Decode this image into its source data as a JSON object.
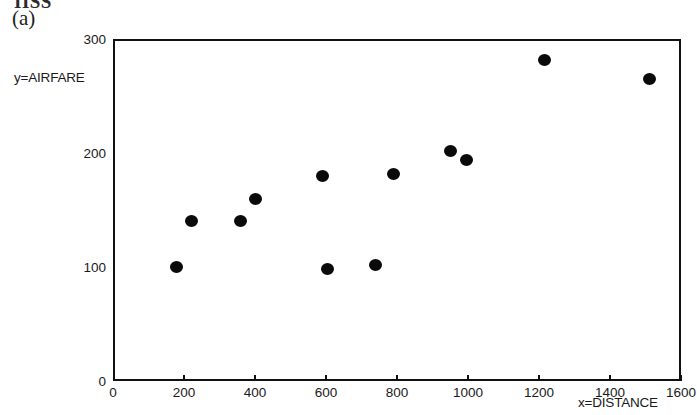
{
  "figure": {
    "cropped_header_text": "IISS",
    "panel_label": "(a)"
  },
  "chart_data": {
    "type": "scatter",
    "title": "",
    "xlabel": "x=DISTANCE",
    "ylabel": "y=AIRFARE",
    "xlim": [
      0,
      1600
    ],
    "ylim": [
      0,
      300
    ],
    "xticks": [
      0,
      200,
      400,
      600,
      800,
      1000,
      1200,
      1400,
      1600
    ],
    "yticks": [
      0,
      100,
      200,
      300
    ],
    "grid": false,
    "legend": null,
    "marker": "filled-circle",
    "marker_color": "#0a0a0a",
    "series": [
      {
        "name": "airfare vs distance",
        "points": [
          {
            "x": 180,
            "y": 100
          },
          {
            "x": 220,
            "y": 140
          },
          {
            "x": 360,
            "y": 140
          },
          {
            "x": 400,
            "y": 160
          },
          {
            "x": 590,
            "y": 180
          },
          {
            "x": 605,
            "y": 98
          },
          {
            "x": 740,
            "y": 102
          },
          {
            "x": 790,
            "y": 182
          },
          {
            "x": 950,
            "y": 202
          },
          {
            "x": 995,
            "y": 194
          },
          {
            "x": 1215,
            "y": 282
          },
          {
            "x": 1510,
            "y": 265
          }
        ]
      }
    ]
  },
  "style": {
    "axis_color": "#111111",
    "text_color": "#1a1a1a",
    "background": "#ffffff"
  }
}
